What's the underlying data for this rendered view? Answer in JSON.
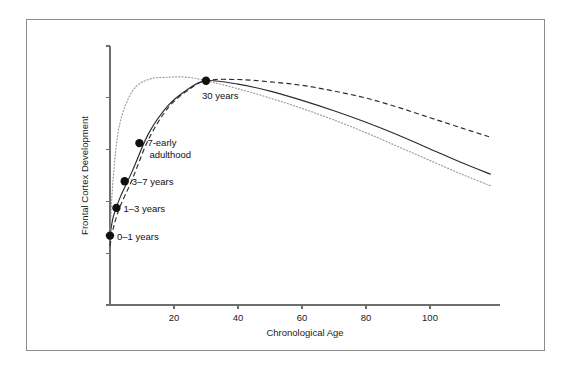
{
  "chart_data": {
    "type": "line",
    "title": "",
    "xlabel": "Chronological Age",
    "ylabel": "Frontal Cortex Development",
    "xlim": [
      0,
      119
    ],
    "ylim": [
      0,
      1.12
    ],
    "grid": false,
    "legend_position": "none",
    "x_ticks": [
      20,
      40,
      60,
      80,
      100
    ],
    "x_tick_labels": [
      "20",
      "40",
      "60",
      "80",
      "100"
    ],
    "y_ticks_count": 6,
    "y_tick_labels": [],
    "series": [
      {
        "name": "typical-development",
        "style": "solid",
        "color": "#2b2b2b",
        "x": [
          0,
          1,
          3,
          7,
          12,
          18,
          24,
          30,
          40,
          50,
          60,
          70,
          80,
          90,
          100,
          110,
          119
        ],
        "values": [
          0.3,
          0.38,
          0.46,
          0.58,
          0.74,
          0.86,
          0.93,
          0.97,
          0.955,
          0.925,
          0.885,
          0.84,
          0.79,
          0.735,
          0.675,
          0.615,
          0.565
        ]
      },
      {
        "name": "delayed-development",
        "style": "dashed",
        "color": "#2b2b2b",
        "x": [
          0,
          1,
          3,
          7,
          12,
          18,
          24,
          30,
          40,
          50,
          60,
          70,
          80,
          90,
          100,
          110,
          119
        ],
        "values": [
          0.255,
          0.33,
          0.42,
          0.545,
          0.715,
          0.85,
          0.925,
          0.97,
          0.975,
          0.965,
          0.95,
          0.925,
          0.895,
          0.855,
          0.81,
          0.765,
          0.725
        ]
      },
      {
        "name": "accelerated-development",
        "style": "dotted",
        "color": "#9a9a9a",
        "x": [
          0,
          1,
          3,
          7,
          12,
          18,
          24,
          30,
          40,
          50,
          60,
          70,
          80,
          90,
          100,
          110,
          119
        ],
        "values": [
          0.3,
          0.55,
          0.78,
          0.925,
          0.975,
          0.985,
          0.985,
          0.97,
          0.935,
          0.895,
          0.85,
          0.8,
          0.745,
          0.685,
          0.625,
          0.565,
          0.515
        ]
      }
    ],
    "annotations": [
      {
        "name": "stage-0-1-years",
        "label": "0–1 years",
        "x": 0,
        "y": 0.3,
        "marker": true,
        "label_dx": 7,
        "label_dy": 4
      },
      {
        "name": "stage-1-3-years",
        "label": "1–3 years",
        "x": 2,
        "y": 0.42,
        "marker": true,
        "label_dx": 7,
        "label_dy": 4
      },
      {
        "name": "stage-3-7-years",
        "label": "3–7 years",
        "x": 4.6,
        "y": 0.535,
        "marker": true,
        "label_dx": 7,
        "label_dy": 4
      },
      {
        "name": "stage-7-early-adulthood",
        "label": "7-early",
        "label2": "adulthood",
        "x": 9.2,
        "y": 0.7,
        "marker": true,
        "label_dx": 8,
        "label_dy": 3
      },
      {
        "name": "stage-30-years",
        "label": "30 years",
        "x": 30,
        "y": 0.97,
        "marker": true,
        "label_dx": -4,
        "label_dy": 18
      }
    ]
  }
}
